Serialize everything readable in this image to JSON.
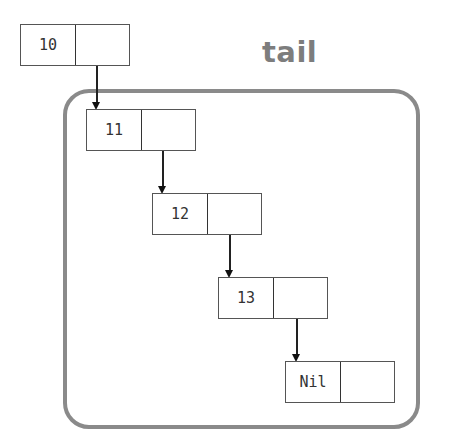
{
  "diagram": {
    "title": "tail",
    "group_label": "tail",
    "nodes": [
      {
        "id": "n10",
        "value": "10",
        "inside_tail": false
      },
      {
        "id": "n11",
        "value": "11",
        "inside_tail": true
      },
      {
        "id": "n12",
        "value": "12",
        "inside_tail": true
      },
      {
        "id": "n13",
        "value": "13",
        "inside_tail": true
      },
      {
        "id": "nNil",
        "value": "Nil",
        "inside_tail": true
      }
    ],
    "edges": [
      {
        "from": "n10",
        "to": "n11"
      },
      {
        "from": "n11",
        "to": "n12"
      },
      {
        "from": "n12",
        "to": "n13"
      },
      {
        "from": "n13",
        "to": "nNil"
      }
    ],
    "colors": {
      "group_border": "#8a8a8a",
      "group_label": "#7d7d7d",
      "node_border": "#555555",
      "arrow": "#111111"
    }
  }
}
